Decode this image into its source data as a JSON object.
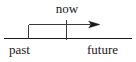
{
  "diagram": {
    "type": "timeline-arrow",
    "background_color": "#ffffff",
    "stroke_color": "#1a1a1a",
    "text_color": "#1a1a1a",
    "labels": {
      "now": "now",
      "past": "past",
      "future": "future"
    },
    "geometry": {
      "baseline": {
        "x1": 4,
        "y1": 38.5,
        "x2": 132,
        "y2": 38.5
      },
      "arrow_line": {
        "x1": 28.5,
        "y1": 24.5,
        "x2": 99,
        "y2": 24.5
      },
      "left_riser": {
        "x": 28.5,
        "y1": 24.5,
        "y2": 38.5
      },
      "now_tick": {
        "x": 66.5,
        "y1": 20,
        "y2": 40
      },
      "arrow_head": {
        "tip_x": 100,
        "tip_y": 24.5,
        "length": 11,
        "half_width": 3.2
      }
    }
  }
}
